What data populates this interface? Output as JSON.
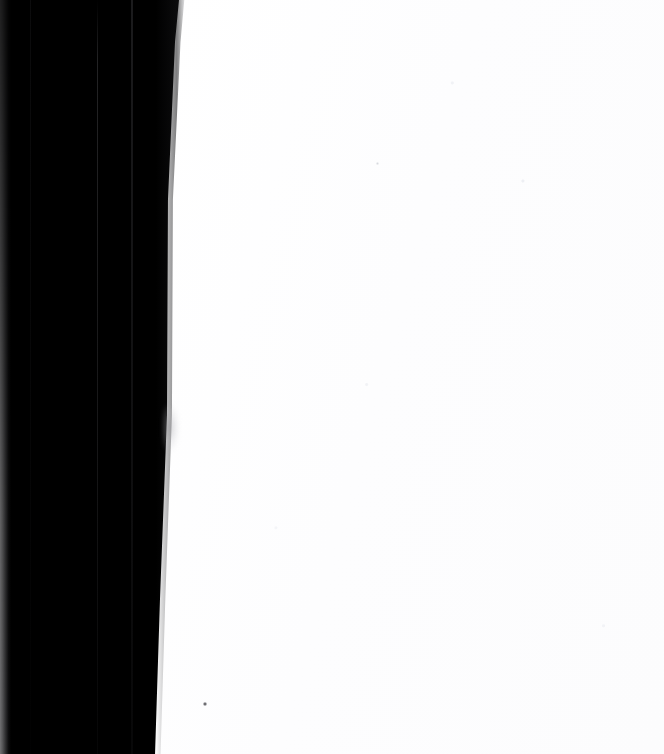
{
  "image": {
    "width": 664,
    "height": 754,
    "description": "Mostly blank white scanned page with a large solid black region along the left side"
  },
  "regions": {
    "paper": {
      "name": "blank-white-page",
      "color": "#fdfdfd"
    },
    "dark_band": {
      "name": "black-band",
      "color": "#000000",
      "edge_note": "right edge slants slightly inward from top to bottom"
    },
    "left_strip": {
      "name": "left-gray-edge-strip",
      "color": "#60605f"
    },
    "seams": [
      {
        "name": "vertical-seam-left",
        "color": "#1a1a1c"
      },
      {
        "name": "vertical-seam-middle",
        "color": "#2e2e30"
      },
      {
        "name": "vertical-seam-right",
        "color": "#202022"
      }
    ]
  },
  "artifacts": {
    "smudge": {
      "name": "edge-smudge",
      "color": "#969699"
    },
    "speck": {
      "name": "dark-speck",
      "color": "#28282c"
    },
    "micro_speck": {
      "name": "faint-micro-speck",
      "color": "#b9bcc4"
    }
  },
  "caption": "Blank white page with black left margin band"
}
